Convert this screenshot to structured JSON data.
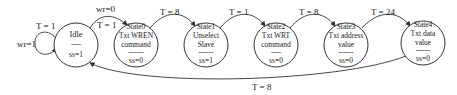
{
  "diagram": {
    "type": "state-machine",
    "states": [
      {
        "id": "idle",
        "lines": [
          "Idle",
          "----",
          "ss=1"
        ]
      },
      {
        "id": "state0",
        "lines": [
          "State0",
          "Txt WREN",
          "command",
          "------",
          "ss=0"
        ]
      },
      {
        "id": "state1",
        "lines": [
          "State1",
          "Unselect",
          "Slave",
          "------",
          "ss=1"
        ]
      },
      {
        "id": "state2",
        "lines": [
          "State2",
          "Txt WRT",
          "command",
          "----",
          "ss=0"
        ]
      },
      {
        "id": "state3",
        "lines": [
          "State3",
          "Txt address",
          "value",
          "------",
          "ss=0"
        ]
      },
      {
        "id": "state4",
        "lines": [
          "State4",
          "Txt data",
          "value",
          "------",
          "ss=0"
        ]
      }
    ],
    "transitions": [
      {
        "from": "idle",
        "to": "idle",
        "label_top": "T = 1",
        "label_side": "wr=1"
      },
      {
        "from": "idle",
        "to": "state0",
        "label_top": "wr=0",
        "label_inner": "T = 1"
      },
      {
        "from": "state0",
        "to": "state1",
        "label": "T = 8"
      },
      {
        "from": "state1",
        "to": "state2",
        "label": "T = 1"
      },
      {
        "from": "state2",
        "to": "state3",
        "label": "T = 8"
      },
      {
        "from": "state3",
        "to": "state4",
        "label": "T = 24"
      },
      {
        "from": "state4",
        "to": "idle",
        "label": "T = 8"
      }
    ]
  }
}
